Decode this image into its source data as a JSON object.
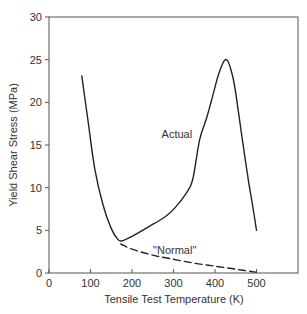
{
  "chart_data": {
    "type": "line",
    "title": "",
    "xlabel": "Tensile Test Temperature (K)",
    "ylabel": "Yield Shear Stress (MPa)",
    "xlim": [
      0,
      600
    ],
    "ylim": [
      0,
      30
    ],
    "xticks": [
      0,
      100,
      200,
      300,
      400,
      500
    ],
    "yticks": [
      0,
      5,
      10,
      15,
      20,
      25,
      30
    ],
    "grid": false,
    "legend": "none",
    "series": [
      {
        "name": "Actual",
        "style": "solid",
        "x": [
          79,
          95,
          111,
          130,
          150,
          165,
          175,
          200,
          243,
          280,
          303,
          330,
          346,
          363,
          380,
          392,
          410,
          428,
          445,
          459,
          466,
          480,
          492,
          500
        ],
        "y": [
          23.1,
          17.5,
          12.0,
          8.0,
          5.2,
          4.0,
          3.75,
          4.3,
          5.5,
          6.6,
          7.6,
          9.3,
          10.9,
          15.6,
          18.2,
          20.3,
          23.5,
          25.0,
          22.5,
          18.0,
          15.6,
          11.0,
          7.5,
          5.0
        ]
      },
      {
        "name": "\"Normal\"",
        "style": "dashed",
        "x": [
          173,
          200,
          250,
          300,
          350,
          400,
          450,
          498
        ],
        "y": [
          3.4,
          2.8,
          2.1,
          1.6,
          1.15,
          0.8,
          0.45,
          0.1
        ]
      }
    ],
    "annotations": [
      {
        "text": "Actual",
        "x": 345,
        "y": 15.8
      },
      {
        "text": "\"Normal\"",
        "x": 355,
        "y": 2.2
      }
    ]
  }
}
